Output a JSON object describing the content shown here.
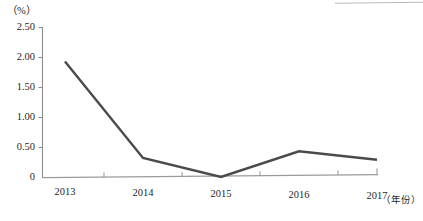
{
  "chart_data": {
    "type": "line",
    "title": "",
    "subtitle": "",
    "xlabel": "（年份）",
    "ylabel": "（%）",
    "categories": [
      "2013",
      "2014",
      "2015",
      "2016",
      "2017"
    ],
    "values": [
      1.93,
      0.32,
      0.0,
      0.43,
      0.29
    ],
    "series": [
      {
        "name": "",
        "values": [
          1.93,
          0.32,
          0.0,
          0.43,
          0.29
        ]
      }
    ],
    "ylim": [
      0,
      2.5
    ],
    "ytick_labels": [
      "2.50",
      "2.00",
      "1.50",
      "1.00",
      "0.50",
      "0"
    ],
    "ytick_values": [
      2.5,
      2.0,
      1.5,
      1.0,
      0.5,
      0
    ],
    "xtick_labels": [
      "2013",
      "2014",
      "2015",
      "2016",
      "2017"
    ],
    "grid": false,
    "legend": "none",
    "line_color": "#4a4a4a",
    "axis_color": "#8a8a8a",
    "markers": false
  },
  "axes": {
    "unit_label": "（%）",
    "x_axis_name": "（年份）",
    "y_ticks": [
      {
        "label": "2.50"
      },
      {
        "label": "2.00"
      },
      {
        "label": "1.50"
      },
      {
        "label": "1.00"
      },
      {
        "label": "0.50"
      },
      {
        "label": "0"
      }
    ],
    "x_ticks": [
      {
        "label": "2013"
      },
      {
        "label": "2014"
      },
      {
        "label": "2015"
      },
      {
        "label": "2016"
      },
      {
        "label": "2017"
      }
    ]
  }
}
